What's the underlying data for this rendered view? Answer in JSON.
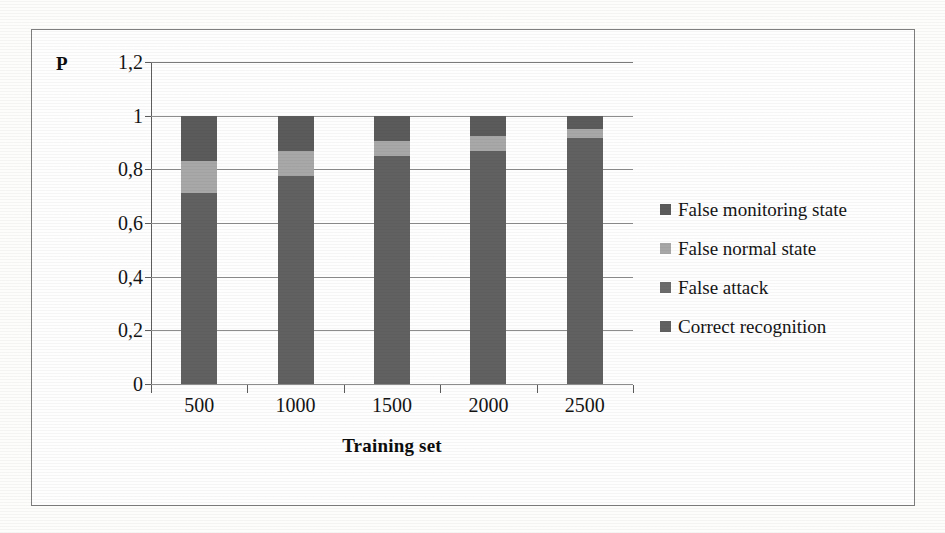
{
  "figure": {
    "y_axis_symbol": "P",
    "x_axis_title": "Training set"
  },
  "chart_data": {
    "type": "bar",
    "subtype": "stacked-bar",
    "title": "",
    "xlabel": "Training set",
    "ylabel": "P",
    "categories": [
      "500",
      "1000",
      "1500",
      "2000",
      "2500"
    ],
    "ylim": [
      0,
      1.2
    ],
    "ytick_labels": [
      "0",
      "0,2",
      "0,4",
      "0,6",
      "0,8",
      "1",
      "1,2"
    ],
    "ytick_values": [
      0,
      0.2,
      0.4,
      0.6,
      0.8,
      1.0,
      1.2
    ],
    "grid": true,
    "legend_position": "right",
    "stack_order_bottom_to_top": [
      "Correct recognition",
      "False attack",
      "False normal state",
      "False monitoring state"
    ],
    "series": [
      {
        "name": "Correct recognition",
        "color": "#616161",
        "values": [
          0.71,
          0.775,
          0.85,
          0.87,
          0.915
        ]
      },
      {
        "name": "False attack",
        "color": "#616161",
        "values": [
          0.0,
          0.0,
          0.0,
          0.0,
          0.0
        ]
      },
      {
        "name": "False normal state",
        "color": "#a8a8a8",
        "values": [
          0.12,
          0.095,
          0.055,
          0.055,
          0.035
        ]
      },
      {
        "name": "False monitoring state",
        "color": "#5b5b5b",
        "values": [
          0.17,
          0.13,
          0.095,
          0.075,
          0.05
        ]
      }
    ]
  },
  "legend": {
    "items": [
      {
        "label": "False monitoring state",
        "color": "#5b5b5b"
      },
      {
        "label": "False normal state",
        "color": "#a8a8a8"
      },
      {
        "label": "False attack",
        "color": "#6b6b6b"
      },
      {
        "label": "Correct recognition",
        "color": "#616161"
      }
    ]
  },
  "colors": {
    "dark_segment": "#616161",
    "light_segment": "#a8a8a8",
    "top_segment": "#5b5b5b",
    "gridline": "#8d8d8d",
    "axis": "#5d5d5d",
    "frame": "#7e7e7e"
  }
}
